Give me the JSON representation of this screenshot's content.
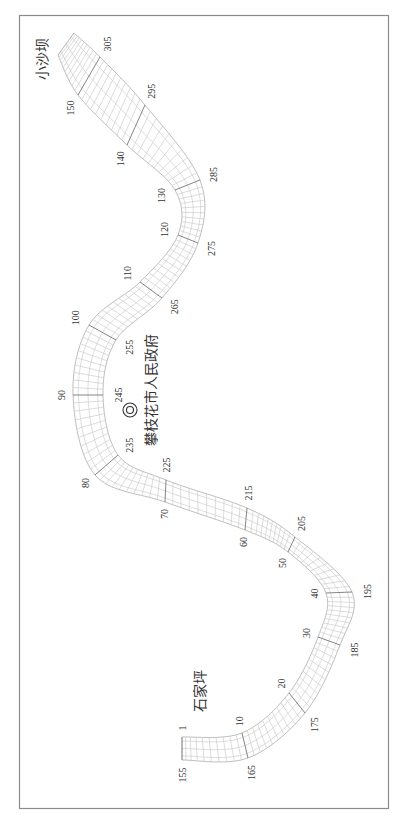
{
  "map": {
    "orientation": "rotated -90deg",
    "places": {
      "upstream": "小沙坝",
      "downstream": "石家坪",
      "government": "攀枝花市人民政府"
    },
    "government_symbol": "double-circle-icon",
    "left_bank_labels": [
      "1",
      "10",
      "20",
      "30",
      "40",
      "50",
      "60",
      "70",
      "80",
      "90",
      "100",
      "110",
      "120",
      "130",
      "140",
      "150"
    ],
    "right_bank_labels": [
      "155",
      "165",
      "175",
      "185",
      "195",
      "205",
      "215",
      "225",
      "235",
      "245",
      "255",
      "265",
      "275",
      "285",
      "295",
      "305"
    ],
    "colors": {
      "frame": "#8a8a8a",
      "bank": "#b8b8b8",
      "section": "#c4c4c4",
      "major_section": "#777777",
      "text": "#333333"
    }
  }
}
